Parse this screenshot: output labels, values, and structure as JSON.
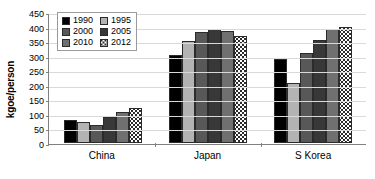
{
  "chart_data": {
    "type": "bar",
    "title": "",
    "subtitle": "",
    "xlabel": "",
    "ylabel": "kgoe/person",
    "ylim": [
      0,
      450
    ],
    "ytick_step": 50,
    "yticks": [
      450,
      400,
      350,
      300,
      250,
      200,
      150,
      100,
      50,
      0
    ],
    "grid": true,
    "legend_position": "top-left-inside",
    "categories": [
      "China",
      "Japan",
      "S Korea"
    ],
    "series": [
      {
        "name": "1990",
        "color": "#000000",
        "pattern": "solid",
        "values": [
          78,
          302,
          288
        ]
      },
      {
        "name": "1995",
        "color": "#b3b3b3",
        "pattern": "solid",
        "values": [
          73,
          352,
          207
        ]
      },
      {
        "name": "2000",
        "color": "#585858",
        "pattern": "solid",
        "values": [
          62,
          383,
          310
        ]
      },
      {
        "name": "2005",
        "color": "#383838",
        "pattern": "solid",
        "values": [
          88,
          390,
          355
        ]
      },
      {
        "name": "2010",
        "color": "#707070",
        "pattern": "solid",
        "values": [
          107,
          385,
          392
        ]
      },
      {
        "name": "2012",
        "color": "#ffffff",
        "pattern": "dotted",
        "values": [
          120,
          368,
          398
        ]
      }
    ]
  },
  "axis": {
    "y_title": "kgoe/person"
  },
  "legend": {
    "items": [
      {
        "label": "1990"
      },
      {
        "label": "1995"
      },
      {
        "label": "2000"
      },
      {
        "label": "2005"
      },
      {
        "label": "2010"
      },
      {
        "label": "2012"
      }
    ]
  }
}
